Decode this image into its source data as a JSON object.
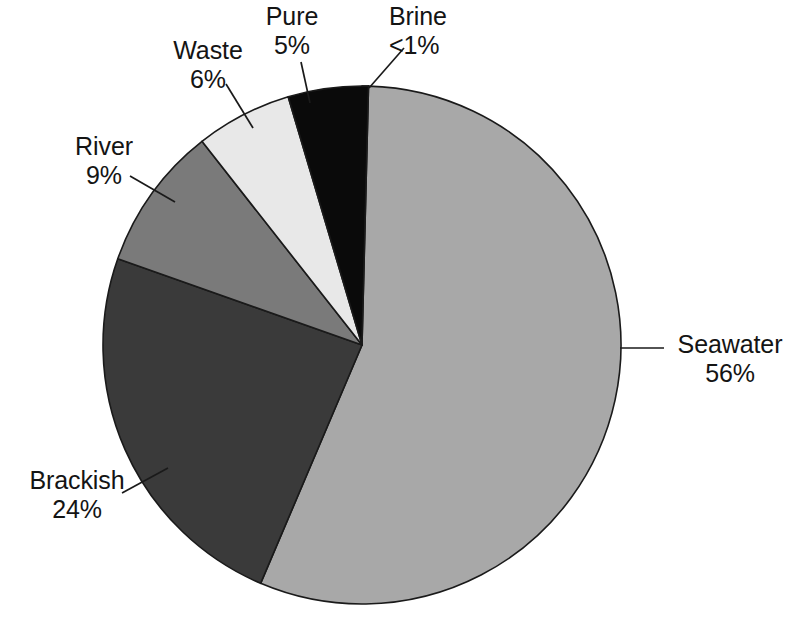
{
  "chart_data": {
    "type": "pie",
    "title": "",
    "subtitle": "",
    "xlabel": "",
    "ylabel": "",
    "legend_position": "none",
    "grid": false,
    "labels_outside": true,
    "start_angle_deg": 0,
    "direction": "clockwise",
    "categories": [
      "Brine",
      "Seawater",
      "Brackish",
      "River",
      "Waste",
      "Pure"
    ],
    "values": [
      0.4,
      56,
      24,
      9,
      6,
      5
    ],
    "value_labels": [
      "<1%",
      "56%",
      "24%",
      "9%",
      "6%",
      "5%"
    ],
    "colors": [
      "#fbfbfb",
      "#a8a8a8",
      "#3a3a3a",
      "#7a7a7a",
      "#e8e8e8",
      "#0a0a0a"
    ],
    "slices": [
      {
        "name": "Brine",
        "value_label": "<1%",
        "value": 0.4,
        "color": "#fbfbfb",
        "start_deg": 0.0,
        "end_deg": 1.44,
        "label_align": "left"
      },
      {
        "name": "Seawater",
        "value_label": "56%",
        "value": 56,
        "color": "#a8a8a8",
        "start_deg": 1.44,
        "end_deg": 203.04,
        "label_align": "left"
      },
      {
        "name": "Brackish",
        "value_label": "24%",
        "value": 24,
        "color": "#3a3a3a",
        "start_deg": 203.04,
        "end_deg": 289.44,
        "label_align": "center"
      },
      {
        "name": "River",
        "value_label": "9%",
        "value": 9,
        "color": "#7a7a7a",
        "start_deg": 289.44,
        "end_deg": 321.84,
        "label_align": "center"
      },
      {
        "name": "Waste",
        "value_label": "6%",
        "value": 6,
        "color": "#e8e8e8",
        "start_deg": 321.84,
        "end_deg": 343.44,
        "label_align": "center"
      },
      {
        "name": "Pure",
        "value_label": "5%",
        "value": 5,
        "color": "#0a0a0a",
        "start_deg": 343.44,
        "end_deg": 361.44,
        "label_align": "center"
      }
    ]
  },
  "labels": {
    "pure": {
      "name": "Pure",
      "value": "5%"
    },
    "brine": {
      "name": "Brine",
      "value": "<1%"
    },
    "waste": {
      "name": "Waste",
      "value": "6%"
    },
    "river": {
      "name": "River",
      "value": "9%"
    },
    "brackish": {
      "name": "Brackish",
      "value": "24%"
    },
    "seawater": {
      "name": "Seawater",
      "value": "56%"
    }
  },
  "colors": {
    "background": "#ffffff",
    "outline": "#1a1a1a",
    "text": "#141414",
    "seawater": "#a8a8a8",
    "brackish": "#3a3a3a",
    "river": "#7a7a7a",
    "waste": "#e8e8e8",
    "pure": "#0a0a0a",
    "brine": "#fbfbfb"
  }
}
